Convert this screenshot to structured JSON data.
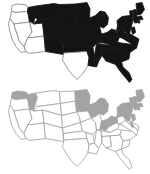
{
  "figure": {
    "title": "",
    "panel_count": 2,
    "background_color": "#ffffff"
  },
  "chart_data": {
    "type": "heatmap",
    "title": "",
    "subtitle": "",
    "xlabel": "",
    "ylabel": "",
    "map_projection": "united-states-albers",
    "legend_position": "none",
    "grid": false,
    "panels": [
      {
        "panel_id": "map-top",
        "label": "",
        "fill_scheme": "binary-black-white",
        "colors": {
          "highlighted": "#141414",
          "plain": "#ffffff",
          "border": "#8c8c8c"
        },
        "categories": [
          "WA",
          "OR",
          "CA",
          "NV",
          "ID",
          "UT",
          "AZ",
          "MT",
          "WY",
          "CO",
          "NM",
          "ND",
          "SD",
          "NE",
          "KS",
          "OK",
          "TX",
          "MN",
          "IA",
          "MO",
          "AR",
          "LA",
          "WI",
          "IL",
          "MS",
          "MI",
          "IN",
          "KY",
          "TN",
          "AL",
          "OH",
          "WV",
          "GA",
          "FL",
          "SC",
          "NC",
          "VA",
          "PA",
          "NY",
          "MD",
          "DE",
          "NJ",
          "CT",
          "RI",
          "MA",
          "VT",
          "NH",
          "ME"
        ],
        "values": [
          0,
          0,
          0,
          0,
          1,
          0,
          0,
          1,
          1,
          1,
          1,
          1,
          1,
          1,
          1,
          1,
          0,
          1,
          1,
          1,
          1,
          1,
          1,
          1,
          1,
          1,
          1,
          1,
          1,
          1,
          1,
          1,
          1,
          1,
          1,
          1,
          1,
          1,
          1,
          1,
          1,
          1,
          1,
          1,
          1,
          1,
          1,
          1
        ]
      },
      {
        "panel_id": "map-bottom",
        "label": "",
        "fill_scheme": "binary-gray-white",
        "colors": {
          "highlighted": "#a3a3a3",
          "plain": "#ffffff",
          "border": "#a8a8a8"
        },
        "categories": [
          "WA",
          "OR",
          "CA",
          "NV",
          "ID",
          "UT",
          "AZ",
          "MT",
          "WY",
          "CO",
          "NM",
          "ND",
          "SD",
          "NE",
          "KS",
          "OK",
          "TX",
          "MN",
          "IA",
          "MO",
          "AR",
          "LA",
          "WI",
          "IL",
          "MS",
          "MI",
          "IN",
          "KY",
          "TN",
          "AL",
          "OH",
          "WV",
          "GA",
          "FL",
          "SC",
          "NC",
          "VA",
          "PA",
          "NY",
          "MD",
          "DE",
          "NJ",
          "CT",
          "RI",
          "MA",
          "VT",
          "NH",
          "ME"
        ],
        "values": [
          1,
          0,
          0,
          0,
          1,
          0,
          0,
          0,
          0,
          0,
          0,
          0,
          0,
          0,
          0,
          0,
          0,
          1,
          0,
          0,
          0,
          0,
          1,
          0,
          0,
          1,
          1,
          0,
          0,
          0,
          1,
          0,
          0,
          0,
          0,
          0,
          0,
          1,
          1,
          0,
          1,
          1,
          1,
          1,
          1,
          1,
          1,
          1
        ]
      }
    ]
  },
  "accessibility": {
    "top_map_description": "United States map with most states filled solid black; western states unfilled",
    "bottom_map_description": "United States map with northern and northeastern states shaded gray; remaining states unfilled"
  }
}
